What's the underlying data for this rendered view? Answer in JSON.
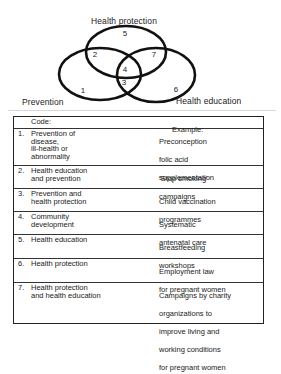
{
  "venn": {
    "sets": [
      {
        "id": "prevention",
        "label": "Prevention"
      },
      {
        "id": "health_protection",
        "label": "Health protection"
      },
      {
        "id": "health_education",
        "label": "Health education"
      }
    ],
    "regions": [
      {
        "code": "1",
        "sets": [
          "prevention"
        ]
      },
      {
        "code": "2",
        "sets": [
          "prevention",
          "health_protection"
        ]
      },
      {
        "code": "3",
        "sets": [
          "prevention",
          "health_education"
        ]
      },
      {
        "code": "4",
        "sets": [
          "prevention",
          "health_protection",
          "health_education"
        ]
      },
      {
        "code": "5",
        "sets": [
          "health_protection"
        ]
      },
      {
        "code": "6",
        "sets": [
          "health_education"
        ]
      },
      {
        "code": "7",
        "sets": [
          "health_protection",
          "health_education"
        ]
      }
    ]
  },
  "table": {
    "header": {
      "code": "Code:",
      "example": "Example:"
    },
    "rows": [
      {
        "num": "1.",
        "code": "Prevention of\ndisease,\nill-health or\nabnormality",
        "example": "Preconception\nfolic acid\nsupplementation"
      },
      {
        "num": "2.",
        "code": "Health education\nand prevention",
        "example": "‘Stop smoking’\ncampaigns"
      },
      {
        "num": "3.",
        "code": "Prevention and\nhealth protection",
        "example": "Child vaccination\nprogrammes"
      },
      {
        "num": "4.",
        "code": "Community\ndevelopment",
        "example": "Systematic\nantenatal care"
      },
      {
        "num": "5.",
        "code": "Health education",
        "example": "Breastfeeding\nworkshops"
      },
      {
        "num": "6.",
        "code": "Health protection",
        "example": "Employment law\nfor pregnant women"
      },
      {
        "num": "7.",
        "code": "Health protection\nand health education",
        "example": "Campaigns by charity\norganizations to\nimprove living and\nworking conditions\nfor pregnant women"
      }
    ]
  }
}
